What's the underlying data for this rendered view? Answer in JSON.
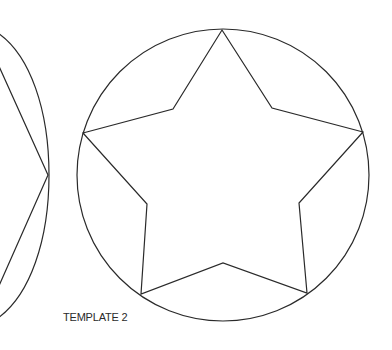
{
  "caption": "TEMPLATE 2",
  "stroke_color": "#2a2a2a",
  "background": "#ffffff",
  "shapes": {
    "left_partial_template": "ellipse-with-star (cropped)",
    "main_template": "circle-with-inscribed-star"
  }
}
